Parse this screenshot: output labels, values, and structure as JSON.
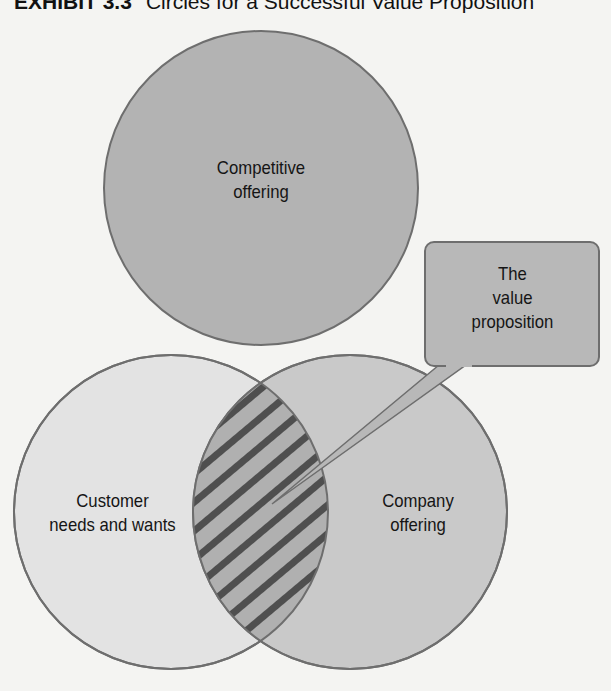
{
  "title": {
    "exhibit": "EXHIBIT 3.3",
    "text": "Circles for a Successful Value Proposition"
  },
  "diagram": {
    "circles": [
      {
        "id": "competitive",
        "label_line1": "Competitive",
        "label_line2": "offering",
        "fill": "#b3b3b3"
      },
      {
        "id": "customer",
        "label_line1": "Customer",
        "label_line2": "needs and wants",
        "fill": "#e3e3e3"
      },
      {
        "id": "company",
        "label_line1": "Company",
        "label_line2": "offering",
        "fill": "#c9c9c9"
      }
    ],
    "intersection": {
      "pattern": "diagonal-hatch",
      "fill": "#b0b0b0",
      "stripe": "#555555"
    },
    "callout": {
      "line1": "The",
      "line2": "value",
      "line3": "proposition",
      "fill": "#b8b8b8"
    },
    "stroke_color": "#6e6e6e"
  }
}
